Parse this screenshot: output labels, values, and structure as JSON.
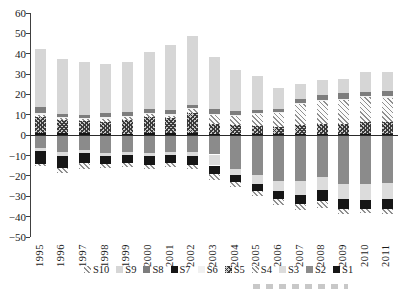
{
  "chart_data": {
    "type": "bar",
    "stacked": true,
    "title": "",
    "xlabel": "",
    "ylabel": "",
    "ylim": [
      -50,
      60
    ],
    "ytick_step": 10,
    "grid": false,
    "legend_position": "bottom",
    "legend_order": [
      "S10",
      "S9",
      "S8",
      "S7",
      "S6",
      "S5",
      "S4",
      "S3",
      "S2",
      "S1"
    ],
    "categories": [
      "1995",
      "1996",
      "1997",
      "1998",
      "1999",
      "2000",
      "2001",
      "2002",
      "2003",
      "2004",
      "2005",
      "2006",
      "2007",
      "2008",
      "2009",
      "2010",
      "2011"
    ],
    "series": [
      {
        "name": "S1",
        "pattern": "solid-black",
        "values": [
          1,
          1,
          1,
          0.5,
          0.5,
          1,
          1,
          1,
          0.5,
          0.5,
          0.5,
          0.5,
          0.5,
          0.5,
          0.5,
          0.5,
          0.5
        ]
      },
      {
        "name": "S2",
        "pattern": "solid-midgray",
        "values": [
          -6,
          -8,
          -7,
          -8.5,
          -8,
          -8.5,
          -8,
          -8,
          -9,
          -16,
          -19,
          -22,
          -22,
          -20,
          -23.5,
          -23.5,
          -23
        ]
      },
      {
        "name": "S3",
        "pattern": "solid-paler",
        "values": [
          -1.5,
          -1.5,
          -1.2,
          -1,
          -1.2,
          -1,
          -1.2,
          -1.5,
          -5.4,
          -3,
          -4.5,
          -5,
          -7,
          -6.5,
          -7.5,
          -8,
          -8
        ]
      },
      {
        "name": "S4",
        "pattern": "diagonal-hatch",
        "values": [
          1,
          1,
          1,
          1.5,
          1.5,
          1.5,
          1,
          2,
          4.5,
          4.5,
          6,
          7,
          10.5,
          11.5,
          12,
          12.3,
          12
        ]
      },
      {
        "name": "S5",
        "pattern": "cross-hatch",
        "values": [
          8,
          6.5,
          6,
          6,
          7,
          8,
          7.5,
          10,
          5,
          4.5,
          4,
          3.5,
          4.5,
          5,
          5,
          6,
          6
        ]
      },
      {
        "name": "S6",
        "pattern": "solid-palegray",
        "values": [
          1,
          0.5,
          0.5,
          1,
          0.5,
          0.5,
          1,
          0.5,
          0.5,
          0.5,
          0.5,
          0.5,
          0.5,
          0.5,
          0.5,
          0.5,
          0.5
        ]
      },
      {
        "name": "S7",
        "pattern": "solid-black",
        "values": [
          -6,
          -6,
          -5,
          -4,
          -4,
          -4.5,
          -4,
          -4.5,
          -4,
          -3.5,
          -3.5,
          -4,
          -4.5,
          -5.5,
          -5,
          -4.5,
          -5
        ]
      },
      {
        "name": "S8",
        "pattern": "solid-darkgray",
        "values": [
          3,
          1.5,
          1.5,
          2,
          2,
          2,
          2,
          1.5,
          2.5,
          2,
          1.5,
          1.5,
          2,
          2,
          2.5,
          2,
          2.5
        ]
      },
      {
        "name": "S9",
        "pattern": "solid-lightgray",
        "values": [
          28.5,
          27,
          26,
          24,
          24.5,
          28,
          32,
          33.5,
          25.5,
          20,
          16.5,
          10,
          7,
          7.5,
          7,
          9.7,
          9.5
        ]
      },
      {
        "name": "S10",
        "pattern": "diagonal-hatch",
        "values": [
          -1.3,
          -2.6,
          -2.8,
          -2.2,
          -2,
          -2,
          -2,
          -2,
          -3,
          -2.5,
          -2.5,
          -3,
          -2.7,
          -3.2,
          -2,
          -1.8,
          -2
        ]
      }
    ],
    "positive_stack_order_from_axis": [
      "S1",
      "S5",
      "S4",
      "S6",
      "S8",
      "S9"
    ],
    "negative_stack_order_from_axis": [
      "S2",
      "S3",
      "S7",
      "S10"
    ],
    "colors": {
      "black": "#161616",
      "dark_gray": "#7d7d7d",
      "mid_gray": "#8b8b8b",
      "light_gray": "#d6d6d6",
      "pale_gray": "#f1f1f1",
      "axis": "#404040"
    }
  }
}
